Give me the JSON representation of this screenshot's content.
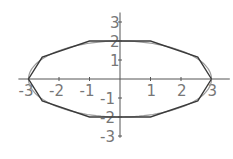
{
  "chart_data": {
    "type": "line",
    "title": "",
    "xlabel": "",
    "ylabel": "",
    "xlim": [
      -3.2,
      3.6
    ],
    "ylim": [
      -3.2,
      3.5
    ],
    "grid": false,
    "legend": null,
    "x_ticks": [
      -3,
      -2,
      -1,
      1,
      2,
      3
    ],
    "x_tick_labels": [
      "-3",
      "-2",
      "-1",
      "1",
      "2",
      "3"
    ],
    "y_ticks": [
      -3,
      -2,
      -1,
      1,
      2,
      3
    ],
    "y_tick_labels": [
      "-3",
      "-2",
      "-1",
      "1",
      "2",
      "3"
    ],
    "series": [
      {
        "name": "ellipse",
        "description": "x^2/9 + y^2/4 = 1",
        "parametric": {
          "a": 3,
          "b": 2
        },
        "color": "#9a9a9a"
      },
      {
        "name": "approximating-polygon",
        "color": "#3a3a3a",
        "points": [
          [
            3,
            0
          ],
          [
            2.55,
            1.15
          ],
          [
            1,
            2
          ],
          [
            -1,
            2
          ],
          [
            -2.55,
            1.15
          ],
          [
            -3,
            0
          ],
          [
            -2.55,
            -1.15
          ],
          [
            -1,
            -2
          ],
          [
            1,
            -2
          ],
          [
            2.55,
            -1.15
          ],
          [
            3,
            0
          ]
        ]
      }
    ]
  },
  "layout": {
    "origin_px": [
      120,
      79
    ],
    "x_scale_px": 30.5,
    "y_scale_px": 19
  }
}
